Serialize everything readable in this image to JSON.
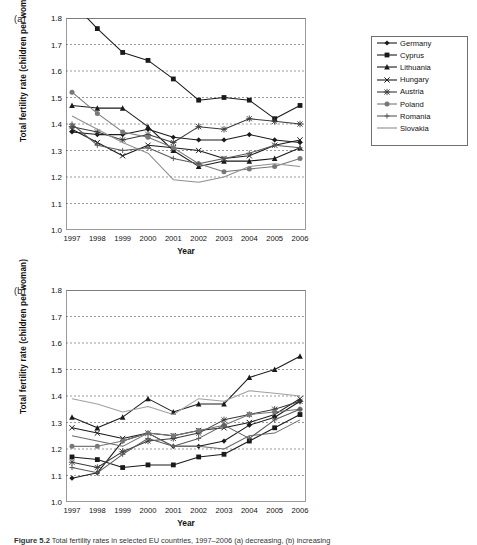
{
  "figure": {
    "caption_prefix": "Figure 5.2",
    "caption_text": "Total fertility rates in selected EU countries, 1997–2006 (a) decreasing, (b) increasing"
  },
  "panels": [
    {
      "key": "a",
      "label": "(a)",
      "ylabel": "Total fertility rate (children per woman)",
      "xlabel": "Year",
      "yticks": [
        "1.0",
        "1.1",
        "1.2",
        "1.3",
        "1.4",
        "1.5",
        "1.6",
        "1.7",
        "1.8"
      ],
      "xticks": [
        "1997",
        "1998",
        "1999",
        "2000",
        "2001",
        "2002",
        "2003",
        "2004",
        "2005",
        "2006"
      ],
      "legend": [
        {
          "label": "Germany",
          "marker": "diamond",
          "color": "#1a1a1a"
        },
        {
          "label": "Cyprus",
          "marker": "square",
          "color": "#1a1a1a"
        },
        {
          "label": "Lithuania",
          "marker": "triangle",
          "color": "#1a1a1a"
        },
        {
          "label": "Hungary",
          "marker": "x",
          "color": "#1a1a1a"
        },
        {
          "label": "Austria",
          "marker": "star",
          "color": "#3a3a3a"
        },
        {
          "label": "Poland",
          "marker": "circle",
          "color": "#777777"
        },
        {
          "label": "Romania",
          "marker": "plus",
          "color": "#5a5a5a"
        },
        {
          "label": "Slovakia",
          "marker": "none",
          "color": "#8f8f8f"
        }
      ]
    },
    {
      "key": "b",
      "label": "(b)",
      "ylabel": "Total fertility rate (children per woman)",
      "xlabel": "Year",
      "yticks": [
        "1.0",
        "1.1",
        "1.2",
        "1.3",
        "1.4",
        "1.5",
        "1.6",
        "1.7",
        "1.8"
      ],
      "xticks": [
        "1997",
        "1998",
        "1999",
        "2000",
        "2001",
        "2002",
        "2003",
        "2004",
        "2005",
        "2006"
      ],
      "legend": [
        {
          "label": "Bulgaria",
          "marker": "diamond",
          "color": "#1a1a1a"
        },
        {
          "label": "Czech Republic",
          "marker": "square",
          "color": "#1a1a1a"
        },
        {
          "label": "Estonia",
          "marker": "triangle",
          "color": "#1a1a1a"
        },
        {
          "label": "Greece",
          "marker": "x",
          "color": "#1a1a1a"
        },
        {
          "label": "Spain",
          "marker": "star",
          "color": "#3a3a3a"
        },
        {
          "label": "Italy",
          "marker": "circle",
          "color": "#777777"
        },
        {
          "label": "Latvia",
          "marker": "plus",
          "color": "#5a5a5a"
        },
        {
          "label": "Austria",
          "marker": "none",
          "color": "#a0a0a0"
        },
        {
          "label": "Slovenia",
          "marker": "none",
          "color": "#6a6a6a"
        }
      ]
    }
  ],
  "chart_data": [
    {
      "type": "line",
      "panel": "(a)",
      "title": "",
      "xlabel": "Year",
      "ylabel": "Total fertility rate (children per woman)",
      "x": [
        1997,
        1998,
        1999,
        2000,
        2001,
        2002,
        2003,
        2004,
        2005,
        2006
      ],
      "ylim": [
        1.0,
        1.8
      ],
      "xlim": [
        1997,
        2006
      ],
      "grid": true,
      "legend_position": "right",
      "series": [
        {
          "name": "Germany",
          "marker": "diamond",
          "color": "#1a1a1a",
          "values": [
            1.37,
            1.36,
            1.36,
            1.38,
            1.35,
            1.34,
            1.34,
            1.36,
            1.34,
            1.33
          ]
        },
        {
          "name": "Cyprus",
          "marker": "square",
          "color": "#1a1a1a",
          "values": [
            1.86,
            1.76,
            1.67,
            1.64,
            1.57,
            1.49,
            1.5,
            1.49,
            1.42,
            1.47
          ]
        },
        {
          "name": "Lithuania",
          "marker": "triangle",
          "color": "#1a1a1a",
          "values": [
            1.47,
            1.46,
            1.46,
            1.39,
            1.3,
            1.24,
            1.26,
            1.26,
            1.27,
            1.31
          ]
        },
        {
          "name": "Hungary",
          "marker": "x",
          "color": "#1a1a1a",
          "values": [
            1.38,
            1.33,
            1.28,
            1.32,
            1.31,
            1.3,
            1.27,
            1.28,
            1.32,
            1.34
          ]
        },
        {
          "name": "Austria",
          "marker": "star",
          "color": "#3a3a3a",
          "values": [
            1.39,
            1.37,
            1.34,
            1.36,
            1.33,
            1.39,
            1.38,
            1.42,
            1.41,
            1.4
          ]
        },
        {
          "name": "Poland",
          "marker": "circle",
          "color": "#777777",
          "values": [
            1.52,
            1.44,
            1.37,
            1.35,
            1.31,
            1.25,
            1.22,
            1.23,
            1.24,
            1.27
          ]
        },
        {
          "name": "Romania",
          "marker": "plus",
          "color": "#5a5a5a",
          "values": [
            1.4,
            1.32,
            1.3,
            1.31,
            1.27,
            1.25,
            1.27,
            1.29,
            1.32,
            1.31
          ]
        },
        {
          "name": "Slovakia",
          "marker": "none",
          "color": "#8f8f8f",
          "values": [
            1.43,
            1.38,
            1.33,
            1.29,
            1.19,
            1.18,
            1.2,
            1.24,
            1.25,
            1.24
          ]
        }
      ]
    },
    {
      "type": "line",
      "panel": "(b)",
      "title": "",
      "xlabel": "Year",
      "ylabel": "Total fertility rate (children per woman)",
      "x": [
        1997,
        1998,
        1999,
        2000,
        2001,
        2002,
        2003,
        2004,
        2005,
        2006
      ],
      "ylim": [
        1.0,
        1.8
      ],
      "xlim": [
        1997,
        2006
      ],
      "grid": true,
      "legend_position": "right",
      "series": [
        {
          "name": "Bulgaria",
          "marker": "diamond",
          "color": "#1a1a1a",
          "values": [
            1.09,
            1.11,
            1.23,
            1.26,
            1.21,
            1.21,
            1.23,
            1.29,
            1.32,
            1.38
          ]
        },
        {
          "name": "Czech Republic",
          "marker": "square",
          "color": "#1a1a1a",
          "values": [
            1.17,
            1.16,
            1.13,
            1.14,
            1.14,
            1.17,
            1.18,
            1.23,
            1.28,
            1.33
          ]
        },
        {
          "name": "Estonia",
          "marker": "triangle",
          "color": "#1a1a1a",
          "values": [
            1.32,
            1.28,
            1.32,
            1.39,
            1.34,
            1.37,
            1.37,
            1.47,
            1.5,
            1.55
          ]
        },
        {
          "name": "Greece",
          "marker": "x",
          "color": "#1a1a1a",
          "values": [
            1.28,
            1.26,
            1.24,
            1.26,
            1.25,
            1.27,
            1.28,
            1.3,
            1.33,
            1.39
          ]
        },
        {
          "name": "Spain",
          "marker": "star",
          "color": "#3a3a3a",
          "values": [
            1.15,
            1.13,
            1.19,
            1.23,
            1.24,
            1.26,
            1.31,
            1.33,
            1.35,
            1.38
          ]
        },
        {
          "name": "Italy",
          "marker": "circle",
          "color": "#777777",
          "values": [
            1.21,
            1.21,
            1.23,
            1.26,
            1.25,
            1.27,
            1.29,
            1.33,
            1.34,
            1.35
          ]
        },
        {
          "name": "Latvia",
          "marker": "plus",
          "color": "#5a5a5a",
          "values": [
            1.13,
            1.11,
            1.18,
            1.24,
            1.21,
            1.24,
            1.29,
            1.24,
            1.31,
            1.35
          ]
        },
        {
          "name": "Austria",
          "marker": "none",
          "color": "#a0a0a0",
          "values": [
            1.39,
            1.37,
            1.34,
            1.36,
            1.33,
            1.39,
            1.38,
            1.42,
            1.41,
            1.4
          ]
        },
        {
          "name": "Slovenia",
          "marker": "none",
          "color": "#6a6a6a",
          "values": [
            1.25,
            1.23,
            1.21,
            1.26,
            1.21,
            1.21,
            1.2,
            1.25,
            1.26,
            1.31
          ]
        }
      ]
    }
  ]
}
